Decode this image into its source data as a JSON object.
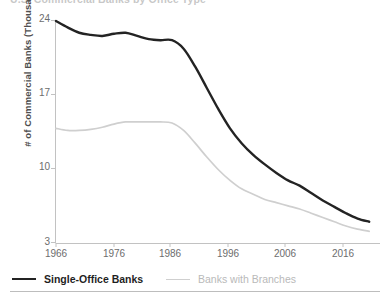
{
  "title_clipped": "U.S. Commercial Banks by Office Type",
  "axes": {
    "ylabel": "# of Commercial Banks (Thousand)",
    "yticks": [
      24,
      17,
      10,
      3
    ],
    "ylim": [
      3,
      24
    ],
    "xticks": [
      1966,
      1976,
      1986,
      1996,
      2006,
      2016
    ],
    "xlim": [
      1966,
      2021
    ],
    "grid": false
  },
  "legend": {
    "position": "bottom-left",
    "items": [
      {
        "label": "Single-Office Banks",
        "color": "#232323"
      },
      {
        "label": "Banks with Branches",
        "color": "#cfcfcf"
      }
    ]
  },
  "chart_data": {
    "type": "line",
    "title": "U.S. Commercial Banks by Office Type",
    "xlabel": "",
    "ylabel": "# of Commercial Banks (Thousand)",
    "xlim": [
      1966,
      2021
    ],
    "ylim": [
      3,
      24
    ],
    "grid": false,
    "x": [
      1966,
      1968,
      1970,
      1972,
      1974,
      1976,
      1978,
      1980,
      1982,
      1984,
      1986,
      1988,
      1990,
      1992,
      1994,
      1996,
      1998,
      2000,
      2002,
      2004,
      2006,
      2008,
      2010,
      2012,
      2014,
      2016,
      2018,
      2020
    ],
    "series": [
      {
        "name": "Single-Office Banks",
        "color": "#232323",
        "values": [
          23.9,
          23.3,
          22.8,
          22.6,
          22.5,
          22.7,
          22.8,
          22.5,
          22.2,
          22.1,
          22.1,
          21.3,
          19.6,
          17.6,
          15.6,
          13.8,
          12.4,
          11.3,
          10.4,
          9.6,
          8.9,
          8.4,
          7.7,
          7.0,
          6.4,
          5.8,
          5.3,
          5.0
        ]
      },
      {
        "name": "Banks with Branches",
        "color": "#cfcfcf",
        "values": [
          13.8,
          13.6,
          13.6,
          13.7,
          13.9,
          14.2,
          14.4,
          14.4,
          14.4,
          14.4,
          14.3,
          13.6,
          12.4,
          11.1,
          9.9,
          8.9,
          8.1,
          7.6,
          7.1,
          6.8,
          6.5,
          6.2,
          5.8,
          5.4,
          5.0,
          4.6,
          4.3,
          4.1
        ]
      }
    ]
  }
}
